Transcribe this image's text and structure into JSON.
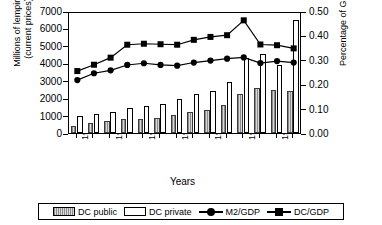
{
  "axes": {
    "left_title": "Millions of lempiras\n(current prices)",
    "right_title": "Percentage of GDP",
    "x_title": "Years",
    "left_ticks": [
      "7000",
      "6000",
      "5000",
      "4000",
      "3000",
      "2000",
      "1000",
      "0"
    ],
    "right_ticks": [
      "0.50",
      "0.40",
      "0.30",
      "0.20",
      "0.10",
      "0.00"
    ],
    "x_ticks": [
      "1981",
      "1983",
      "1985",
      "1987",
      "1989",
      "1991",
      "1993"
    ]
  },
  "legend": {
    "items": [
      {
        "label": "DC public",
        "marker": "swatch-hatched"
      },
      {
        "label": "DC private",
        "marker": "swatch-white"
      },
      {
        "label": "M2/GDP",
        "marker": "line-circle"
      },
      {
        "label": "DC/GDP",
        "marker": "line-square"
      }
    ]
  },
  "chart_data": {
    "type": "bar",
    "title": "",
    "xlabel": "Years",
    "ylabel": "Millions of lempiras (current prices)",
    "y2label": "Percentage of GDP",
    "ylim": [
      0,
      7000
    ],
    "y2lim": [
      0.0,
      0.5
    ],
    "grid": false,
    "legend_position": "bottom",
    "categories": [
      "1981",
      "1982",
      "1983",
      "1984",
      "1985",
      "1986",
      "1987",
      "1988",
      "1989",
      "1990",
      "1991",
      "1992",
      "1993",
      "1994"
    ],
    "series": [
      {
        "name": "DC public",
        "axis": "left",
        "type": "bar",
        "values": [
          430,
          600,
          700,
          780,
          830,
          880,
          1060,
          1180,
          1300,
          1620,
          2250,
          2600,
          2450,
          2400
        ]
      },
      {
        "name": "DC private",
        "axis": "left",
        "type": "bar",
        "values": [
          1000,
          1080,
          1180,
          1420,
          1540,
          1680,
          1980,
          2260,
          2400,
          2900,
          4300,
          4550,
          3900,
          6500
        ]
      },
      {
        "name": "M2/GDP",
        "axis": "right",
        "type": "line",
        "marker": "circle",
        "values": [
          0.225,
          0.253,
          0.265,
          0.287,
          0.294,
          0.287,
          0.284,
          0.297,
          0.305,
          0.313,
          0.318,
          0.295,
          0.303,
          0.297
        ]
      },
      {
        "name": "DC/GDP",
        "axis": "right",
        "type": "line",
        "marker": "square",
        "values": [
          0.262,
          0.288,
          0.317,
          0.37,
          0.374,
          0.372,
          0.37,
          0.39,
          0.402,
          0.409,
          0.47,
          0.371,
          0.368,
          0.355
        ]
      }
    ]
  }
}
